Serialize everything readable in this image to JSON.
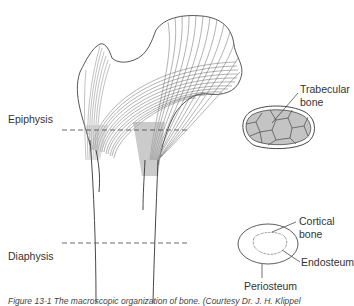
{
  "figure": {
    "labels": {
      "epiphysis": "Epiphysis",
      "diaphysis": "Diaphysis",
      "trabecular_bone_line1": "Trabecular",
      "trabecular_bone_line2": "bone",
      "cortical_bone_line1": "Cortical",
      "cortical_bone_line2": "bone",
      "endosteum": "Endosteum",
      "periosteum": "Periosteum"
    },
    "caption": "Figure 13-1 The macroscopic organization of bone. (Courtesy Dr. J. H. Klippel",
    "colors": {
      "line": "#333333",
      "trabecular_fill": "#c4c4c4",
      "background": "#ffffff"
    }
  }
}
